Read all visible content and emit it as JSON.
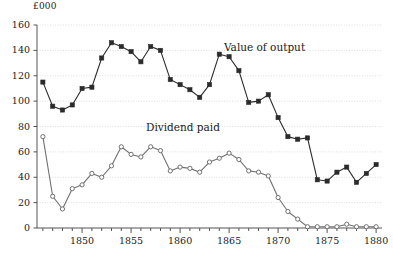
{
  "chart_data": {
    "type": "line",
    "title": "",
    "subtitle": "",
    "xlabel": "",
    "ylabel": "£000",
    "unit_label": "£000",
    "xlim": [
      1845.4,
      1880.6
    ],
    "ylim": [
      0,
      160
    ],
    "yticks": [
      0,
      20,
      40,
      60,
      80,
      100,
      120,
      140,
      160
    ],
    "ytick_labels": [
      "0",
      "20",
      "40",
      "60",
      "80",
      "100",
      "120",
      "140",
      "160"
    ],
    "xticks": [
      1846,
      1847,
      1848,
      1849,
      1850,
      1851,
      1852,
      1853,
      1854,
      1855,
      1856,
      1857,
      1858,
      1859,
      1860,
      1861,
      1862,
      1863,
      1864,
      1865,
      1866,
      1867,
      1868,
      1869,
      1870,
      1871,
      1872,
      1873,
      1874,
      1875,
      1876,
      1877,
      1878,
      1879,
      1880
    ],
    "xtick_labels_major": [
      "1850",
      "1855",
      "1860",
      "1865",
      "1870",
      "1875",
      "1880"
    ],
    "xticks_major": [
      1850,
      1855,
      1860,
      1865,
      1870,
      1875,
      1880
    ],
    "grid": "horizontal-dotted",
    "legend": "inline-annotations",
    "x": [
      1846,
      1847,
      1848,
      1849,
      1850,
      1851,
      1852,
      1853,
      1854,
      1855,
      1856,
      1857,
      1858,
      1859,
      1860,
      1861,
      1862,
      1863,
      1864,
      1865,
      1866,
      1867,
      1868,
      1869,
      1870,
      1871,
      1872,
      1873,
      1874,
      1875,
      1876,
      1877,
      1878,
      1879,
      1880
    ],
    "series": [
      {
        "name": "Value of output",
        "marker": "filled-square",
        "color": "#2b2b2b",
        "values": [
          115,
          96,
          93,
          97,
          110,
          111,
          134,
          146,
          143,
          139,
          131,
          143,
          140,
          117,
          113,
          109,
          103,
          113,
          137,
          135,
          124,
          99,
          100,
          105,
          87,
          72,
          70,
          71,
          38,
          37,
          44,
          48,
          36,
          43,
          50
        ]
      },
      {
        "name": "Dividend paid",
        "marker": "open-circle",
        "color": "#707070",
        "values": [
          72,
          25,
          15,
          31,
          34,
          43,
          40,
          49,
          64,
          58,
          56,
          64,
          61,
          45,
          48,
          47,
          44,
          52,
          55,
          59,
          54,
          45,
          44,
          41,
          24,
          13,
          7,
          1,
          1,
          1,
          1,
          3,
          1,
          1,
          1
        ]
      }
    ],
    "annotations": [
      {
        "text": "Value of output",
        "x_px": 224,
        "y_px": 41
      },
      {
        "text": "Dividend paid",
        "x_px": 146,
        "y_px": 121
      }
    ]
  }
}
